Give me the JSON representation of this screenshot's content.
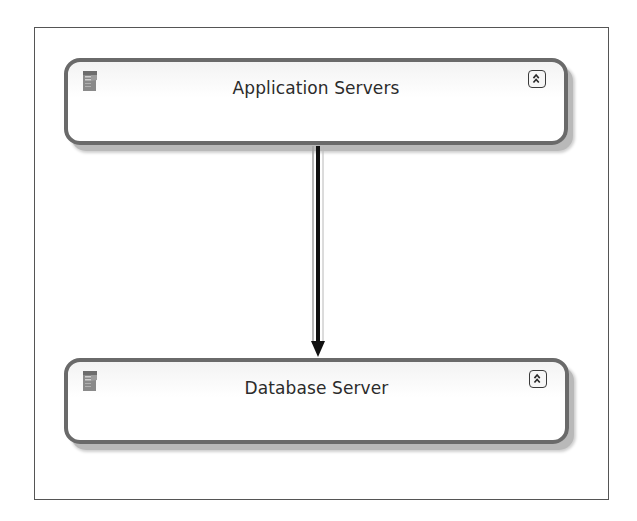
{
  "diagram": {
    "type": "deployment-dependency",
    "nodes": [
      {
        "id": "app",
        "label": "Application Servers",
        "icon": "server-icon",
        "button": "collapse-chevrons-up-icon"
      },
      {
        "id": "db",
        "label": "Database Server",
        "icon": "server-icon",
        "button": "collapse-chevrons-up-icon"
      }
    ],
    "edges": [
      {
        "from": "app",
        "to": "db",
        "style": "solid-arrow"
      }
    ],
    "colors": {
      "node_border": "#6a6a6a",
      "node_shadow": "#b9b9b9",
      "edge": "#111111",
      "frame": "#555555",
      "text": "#2b2b2b"
    }
  }
}
